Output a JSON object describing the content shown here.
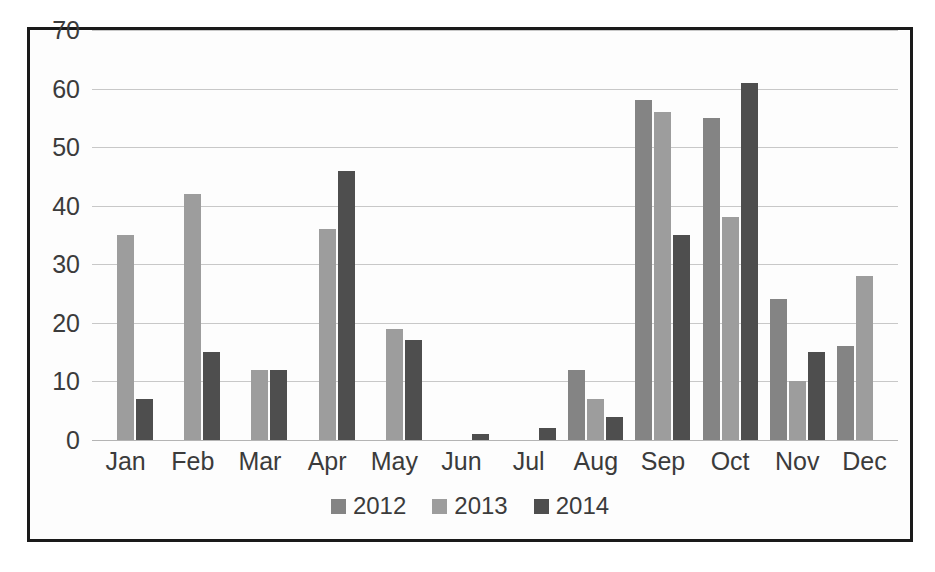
{
  "chart_data": {
    "type": "bar",
    "title": "",
    "xlabel": "",
    "ylabel": "",
    "ylim": [
      0,
      70
    ],
    "ytick_step": 10,
    "yticks": [
      70,
      60,
      50,
      40,
      30,
      20,
      10,
      0
    ],
    "grid": true,
    "legend_position": "bottom",
    "categories": [
      "Jan",
      "Feb",
      "Mar",
      "Apr",
      "May",
      "Jun",
      "Jul",
      "Aug",
      "Sep",
      "Oct",
      "Nov",
      "Dec"
    ],
    "series": [
      {
        "name": "2012",
        "color": "#848484",
        "values": [
          null,
          null,
          null,
          null,
          null,
          null,
          null,
          12,
          58,
          55,
          24,
          16
        ]
      },
      {
        "name": "2013",
        "color": "#9d9d9d",
        "values": [
          35,
          42,
          12,
          36,
          19,
          null,
          null,
          7,
          56,
          38,
          10,
          28
        ]
      },
      {
        "name": "2014",
        "color": "#4e4e4e",
        "values": [
          7,
          15,
          12,
          46,
          17,
          1,
          2,
          4,
          35,
          61,
          15,
          null
        ]
      }
    ]
  },
  "legend": {
    "items": [
      {
        "label": "2012",
        "series_key": "s2012"
      },
      {
        "label": "2013",
        "series_key": "s2013"
      },
      {
        "label": "2014",
        "series_key": "s2014"
      }
    ]
  },
  "colors": {
    "series_2012": "#848484",
    "series_2013": "#9d9d9d",
    "series_2014": "#4e4e4e",
    "gridline": "#c8c8c8",
    "border": "#1a1a1a",
    "text": "#3b3b3b",
    "background": "#ffffff"
  }
}
